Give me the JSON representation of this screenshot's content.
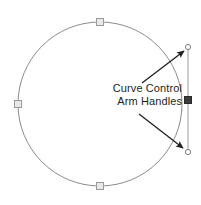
{
  "diagram": {
    "type": "vector-path-node-illustration",
    "background_color": "#ffffff",
    "annotation": {
      "line1": "Curve Control",
      "line2": "Arm Handles",
      "text_color": "#231f20",
      "align": "right"
    },
    "shape": {
      "name": "circle-path",
      "stroke_color": "#8c8c8c",
      "fill": "none",
      "center_x": 100,
      "center_y": 104,
      "radius": 82,
      "stroke_width": 1
    },
    "path_nodes": [
      {
        "name": "node-top",
        "x": 100,
        "y": 22,
        "style": "hollow-square",
        "color": "#9a9a9a"
      },
      {
        "name": "node-left",
        "x": 18,
        "y": 104,
        "style": "hollow-square",
        "color": "#9a9a9a"
      },
      {
        "name": "node-bottom",
        "x": 100,
        "y": 186,
        "style": "hollow-square",
        "color": "#9a9a9a"
      }
    ],
    "selected_node": {
      "name": "node-right-selected",
      "x": 188,
      "y": 100,
      "style": "filled-square",
      "color": "#3b3b3b"
    },
    "control_arm": {
      "name": "control-arm-line",
      "x": 188,
      "y_start": 47,
      "y_end": 152,
      "stroke_color": "#9a9a9a",
      "stroke_width": 1
    },
    "handles": [
      {
        "name": "control-handle-upper",
        "x": 188,
        "y": 47,
        "style": "hollow-circle",
        "color": "#7d7d7d",
        "radius": 2.6
      },
      {
        "name": "control-handle-lower",
        "x": 188,
        "y": 152,
        "style": "hollow-circle",
        "color": "#7d7d7d",
        "radius": 2.6
      }
    ],
    "leader_arrows": [
      {
        "name": "leader-arrow-upper",
        "from_x": 142,
        "from_y": 83,
        "to_x": 184,
        "to_y": 51,
        "color": "#231f20"
      },
      {
        "name": "leader-arrow-lower",
        "from_x": 139,
        "from_y": 114,
        "to_x": 183,
        "to_y": 148,
        "color": "#231f20"
      }
    ]
  }
}
